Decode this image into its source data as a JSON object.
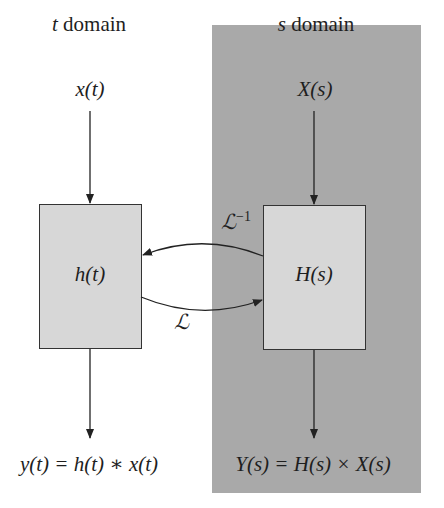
{
  "diagram": {
    "type": "block-diagram",
    "title": "",
    "colors": {
      "background": "#ffffff",
      "s_domain_panel": "#a9a9a9",
      "block_fill": "#d7d7d7",
      "stroke": "#333333"
    },
    "t_domain": {
      "heading_var": "t",
      "heading_text": " domain",
      "input": "x(t)",
      "block": "h(t)",
      "output": "y(t) = h(t) ∗ x(t)"
    },
    "s_domain": {
      "heading_var": "s",
      "heading_text": " domain",
      "input": "X(s)",
      "block": "H(s)",
      "output": "Y(s) = H(s) × X(s)"
    },
    "transforms": {
      "forward": "ℒ",
      "inverse": "ℒ",
      "inverse_sup": "−1"
    },
    "edges": [
      {
        "from": "x(t)",
        "to": "h(t)"
      },
      {
        "from": "h(t)",
        "to": "y(t)"
      },
      {
        "from": "X(s)",
        "to": "H(s)"
      },
      {
        "from": "H(s)",
        "to": "Y(s)"
      },
      {
        "from": "h(t)",
        "to": "H(s)",
        "label": "ℒ"
      },
      {
        "from": "H(s)",
        "to": "h(t)",
        "label": "ℒ−1"
      }
    ]
  }
}
